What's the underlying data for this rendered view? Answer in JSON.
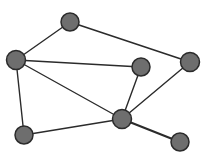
{
  "canvas": {
    "width": 206,
    "height": 167,
    "background": "#ffffff"
  },
  "style": {
    "node_fill": "#6e6e6e",
    "node_stroke": "#2b2b2b",
    "node_stroke_width": 1.5,
    "edge_color": "#2b2b2b",
    "edge_width": 1.4
  },
  "nodes": [
    {
      "id": "A",
      "x": 70,
      "y": 22,
      "r": 9
    },
    {
      "id": "B",
      "x": 16,
      "y": 60,
      "r": 9.5
    },
    {
      "id": "C",
      "x": 141,
      "y": 67,
      "r": 9
    },
    {
      "id": "D",
      "x": 190,
      "y": 62,
      "r": 9.5
    },
    {
      "id": "E",
      "x": 122,
      "y": 119,
      "r": 9.5
    },
    {
      "id": "F",
      "x": 24,
      "y": 135,
      "r": 9
    },
    {
      "id": "G",
      "x": 180,
      "y": 142,
      "r": 9
    }
  ],
  "edges": [
    {
      "from": "A",
      "to": "B",
      "width": 1.4
    },
    {
      "from": "A",
      "to": "D",
      "width": 1.4
    },
    {
      "from": "B",
      "to": "C",
      "width": 1.4
    },
    {
      "from": "B",
      "to": "E",
      "width": 1.4
    },
    {
      "from": "B",
      "to": "F",
      "width": 1.4
    },
    {
      "from": "C",
      "to": "E",
      "width": 1.4
    },
    {
      "from": "D",
      "to": "E",
      "width": 1.4
    },
    {
      "from": "F",
      "to": "E",
      "width": 1.4
    },
    {
      "from": "E",
      "to": "G",
      "width": 2.2
    }
  ]
}
